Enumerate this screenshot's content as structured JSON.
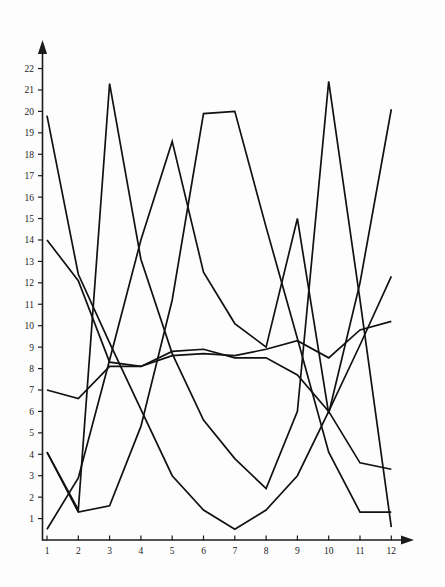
{
  "chart_data": {
    "type": "line",
    "title": "",
    "subtitle": "",
    "xlabel": "",
    "ylabel": "",
    "xlim": [
      1,
      12
    ],
    "ylim": [
      0,
      22.5
    ],
    "grid": false,
    "legend": "none",
    "line_color": "#111111",
    "axis_color": "#1b1b1b",
    "background": "#fdfdfd",
    "x": [
      1,
      2,
      3,
      4,
      5,
      6,
      7,
      8,
      9,
      10,
      11,
      12
    ],
    "xticklabels": [
      "1",
      "2",
      "3",
      "4",
      "5",
      "6",
      "7",
      "8",
      "9",
      "10",
      "11",
      "12"
    ],
    "yticks": [
      1,
      2,
      3,
      4,
      5,
      6,
      7,
      8,
      9,
      10,
      11,
      12,
      13,
      14,
      15,
      16,
      17,
      18,
      19,
      20,
      21,
      22
    ],
    "yticklabels": [
      "1",
      "2",
      "3",
      "4",
      "5",
      "6",
      "7",
      "8",
      "9",
      "10",
      "11",
      "12",
      "13",
      "14",
      "15",
      "16",
      "17",
      "18",
      "19",
      "20",
      "21",
      "22"
    ],
    "series": [
      {
        "name": "series-1",
        "values": [
          19.8,
          12.4,
          9.2,
          6.1,
          3.0,
          1.4,
          0.5,
          1.4,
          3.0,
          6.0,
          9.1,
          12.3
        ]
      },
      {
        "name": "series-2",
        "values": [
          14.0,
          12.1,
          8.3,
          8.1,
          8.6,
          8.7,
          8.6,
          8.9,
          9.3,
          8.5,
          9.8,
          10.2
        ]
      },
      {
        "name": "series-3",
        "values": [
          7.0,
          6.6,
          8.1,
          8.1,
          8.8,
          8.9,
          8.5,
          8.5,
          7.7,
          6.0,
          3.6,
          3.3
        ]
      },
      {
        "name": "series-4",
        "values": [
          4.1,
          1.3,
          1.6,
          5.3,
          11.2,
          19.9,
          20.0,
          14.6,
          9.4,
          4.1,
          1.3,
          1.3
        ]
      },
      {
        "name": "series-5",
        "values": [
          4.1,
          1.4,
          21.3,
          13.1,
          8.7,
          5.6,
          3.8,
          2.4,
          6.0,
          21.4,
          11.2,
          0.6
        ]
      },
      {
        "name": "series-6",
        "values": [
          0.5,
          2.9,
          8.4,
          14.0,
          18.6,
          12.5,
          10.1,
          9.0,
          15.0,
          5.9,
          12.0,
          20.1
        ]
      }
    ]
  },
  "axes": {
    "x_axis_name": "x-axis",
    "y_axis_name": "y-axis"
  }
}
